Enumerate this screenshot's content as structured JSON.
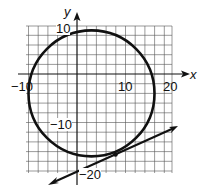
{
  "axes": {
    "x_label": "x",
    "y_label": "y",
    "x_ticks": [
      "−10",
      "10",
      "20"
    ],
    "y_ticks": [
      "10",
      "−10",
      "−20"
    ]
  },
  "figure": {
    "circle": {
      "center": [
        3,
        -4
      ],
      "radius": 13
    },
    "tangent_point": [
      8,
      -16
    ],
    "grid_unit": 2
  }
}
